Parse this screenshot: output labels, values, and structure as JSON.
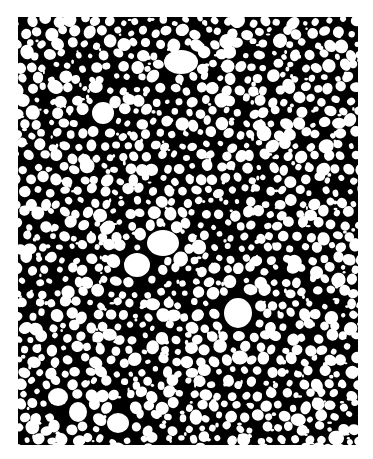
{
  "image": {
    "description": "Black and white cellular bubble texture",
    "frame": {
      "x": 18,
      "y": 17,
      "width": 340,
      "height": 428
    },
    "colors": {
      "background": "#ffffff",
      "matrix": "#000000",
      "cells": "#ffffff"
    },
    "pattern": {
      "seed": 7,
      "spacing": 13,
      "min_r": 2.5,
      "max_r": 7.5
    },
    "large_cells": [
      {
        "cx": 163,
        "cy": 45,
        "rx": 17,
        "ry": 12
      },
      {
        "cx": 145,
        "cy": 226,
        "rx": 16,
        "ry": 13
      },
      {
        "cx": 220,
        "cy": 296,
        "rx": 14,
        "ry": 15
      },
      {
        "cx": 119,
        "cy": 248,
        "rx": 13,
        "ry": 12
      },
      {
        "cx": 85,
        "cy": 96,
        "rx": 11,
        "ry": 11
      },
      {
        "cx": 100,
        "cy": 406,
        "rx": 11,
        "ry": 10
      },
      {
        "cx": 40,
        "cy": 380,
        "rx": 10,
        "ry": 9
      },
      {
        "cx": 60,
        "cy": 395,
        "rx": 9,
        "ry": 10
      }
    ]
  }
}
